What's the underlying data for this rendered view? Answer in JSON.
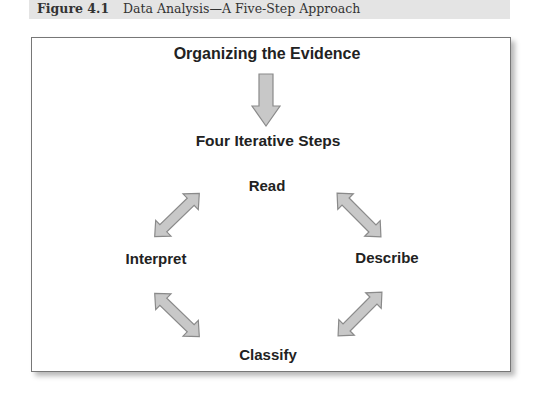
{
  "caption": {
    "label": "Figure 4.1",
    "title": "Data Analysis—A Five-Step Approach"
  },
  "diagram": {
    "top_node": "Organizing the Evidence",
    "subtitle": "Four Iterative Steps",
    "steps": {
      "top": "Read",
      "right": "Describe",
      "bottom": "Classify",
      "left": "Interpret"
    },
    "arrow_fill": "#c8c8c8",
    "arrow_stroke": "#8a8a8a"
  }
}
